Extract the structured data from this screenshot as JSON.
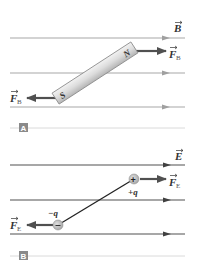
{
  "panels": [
    {
      "id": "A",
      "badge": "A",
      "field_label": "B",
      "field_lines_y": [
        38,
        73,
        107
      ],
      "line_color": "#a8a8a8",
      "magnet": {
        "north_label": "N",
        "south_label": "S"
      },
      "force_label": "F",
      "force_subscript": "B"
    },
    {
      "id": "B",
      "badge": "B",
      "field_label": "E",
      "field_lines_y": [
        165,
        200,
        234
      ],
      "line_color": "#505050",
      "positive_charge": {
        "symbol": "+",
        "label": "+q"
      },
      "negative_charge": {
        "symbol": "−",
        "label": "−q"
      },
      "force_label": "F",
      "force_subscript": "E"
    }
  ],
  "colors": {
    "force_arrow": "#505050",
    "badge_bg": "#8a8a8a",
    "badge_text": "#ffffff",
    "separator": "#d0d0d0",
    "charge_fill": "#b8b8b8"
  }
}
